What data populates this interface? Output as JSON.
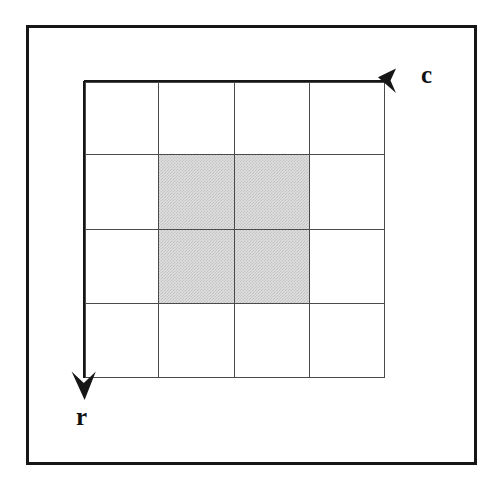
{
  "figure": {
    "background_color": "#ffffff",
    "frame": {
      "name": "outer-frame",
      "border_color": "#161616",
      "border_width_px": 3
    }
  },
  "axes": {
    "horizontal": {
      "label": "c",
      "meaning": "column index",
      "direction": "right",
      "arrow_icon": "arrow-right-icon",
      "line_color": "#161616"
    },
    "vertical": {
      "label": "r",
      "meaning": "row index",
      "direction": "down",
      "arrow_icon": "arrow-down-icon",
      "line_color": "#161616"
    }
  },
  "grid": {
    "rows": 4,
    "cols": 4,
    "cell_width_px": 75.25,
    "cell_height_px": 74.25,
    "line_color": "#4a4a4a",
    "shaded_color": "#dedede",
    "shaded_cells": [
      {
        "row": 1,
        "col": 1
      },
      {
        "row": 1,
        "col": 2
      },
      {
        "row": 2,
        "col": 1
      },
      {
        "row": 2,
        "col": 2
      }
    ],
    "cells": [
      {
        "row": 0,
        "col": 0,
        "shaded": false
      },
      {
        "row": 0,
        "col": 1,
        "shaded": false
      },
      {
        "row": 0,
        "col": 2,
        "shaded": false
      },
      {
        "row": 0,
        "col": 3,
        "shaded": false
      },
      {
        "row": 1,
        "col": 0,
        "shaded": false
      },
      {
        "row": 1,
        "col": 1,
        "shaded": true
      },
      {
        "row": 1,
        "col": 2,
        "shaded": true
      },
      {
        "row": 1,
        "col": 3,
        "shaded": false
      },
      {
        "row": 2,
        "col": 0,
        "shaded": false
      },
      {
        "row": 2,
        "col": 1,
        "shaded": true
      },
      {
        "row": 2,
        "col": 2,
        "shaded": true
      },
      {
        "row": 2,
        "col": 3,
        "shaded": false
      },
      {
        "row": 3,
        "col": 0,
        "shaded": false
      },
      {
        "row": 3,
        "col": 1,
        "shaded": false
      },
      {
        "row": 3,
        "col": 2,
        "shaded": false
      },
      {
        "row": 3,
        "col": 3,
        "shaded": false
      }
    ]
  }
}
